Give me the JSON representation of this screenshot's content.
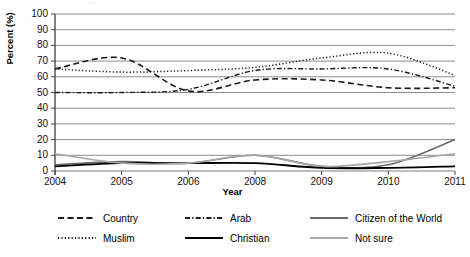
{
  "chart_data": {
    "type": "line",
    "title": "",
    "xlabel": "Year",
    "ylabel": "Percent (%)",
    "categories": [
      "2004",
      "2005",
      "2006",
      "2008",
      "2009",
      "2010",
      "2011"
    ],
    "ylim": [
      0,
      100
    ],
    "ytick_step": 10,
    "yticks": [
      "0",
      "10",
      "20",
      "30",
      "40",
      "50",
      "60",
      "70",
      "80",
      "90",
      "100"
    ],
    "grid": true,
    "legend_position": "bottom",
    "series": [
      {
        "name": "Country",
        "style": "dashed",
        "color": "#1a1a1a",
        "width": 1.6,
        "values": [
          65,
          72,
          51,
          58,
          58,
          53,
          53
        ]
      },
      {
        "name": "Arab",
        "style": "dashdot",
        "color": "#1a1a1a",
        "width": 1.4,
        "values": [
          50,
          50,
          52,
          64,
          65,
          65,
          54
        ]
      },
      {
        "name": "Citizen of the World",
        "style": "solid",
        "color": "#6b6b6b",
        "width": 1.6,
        "values": [
          4,
          6,
          5,
          10,
          3,
          4,
          20
        ]
      },
      {
        "name": "Muslim",
        "style": "dotted",
        "color": "#1a1a1a",
        "width": 1.5,
        "values": [
          65,
          63,
          64,
          66,
          72,
          75,
          61
        ]
      },
      {
        "name": "Christian",
        "style": "solid",
        "color": "#000000",
        "width": 1.8,
        "values": [
          3,
          5,
          5,
          5,
          2,
          2,
          3
        ]
      },
      {
        "name": "Not sure",
        "style": "solid",
        "color": "#a8a8a8",
        "width": 1.6,
        "values": [
          11,
          5,
          5,
          10,
          3,
          6,
          11
        ]
      }
    ]
  },
  "title_fragment": "..."
}
